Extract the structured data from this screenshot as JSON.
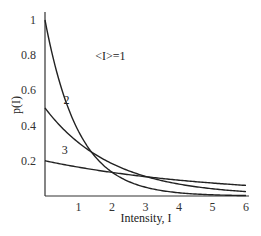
{
  "chart_data": {
    "type": "line",
    "title": "",
    "xlabel": "Intensity, I",
    "ylabel": "p(I)",
    "xlim": [
      0,
      6
    ],
    "ylim": [
      0,
      1
    ],
    "grid": false,
    "legend": "inline curve labels",
    "x_ticks": [
      "1",
      "2",
      "3",
      "4",
      "5",
      "6"
    ],
    "y_ticks": [
      "0.2",
      "0.4",
      "0.6",
      "0.8",
      "1"
    ],
    "function": "p(I) = (1/<I>) exp(-I/<I>)",
    "series": [
      {
        "name": "<I>=1",
        "label": "<I>=1",
        "mean": 1,
        "x": [
          0,
          0.5,
          1,
          1.5,
          2,
          3,
          4,
          5,
          6
        ],
        "values": [
          1.0,
          0.607,
          0.368,
          0.223,
          0.135,
          0.05,
          0.018,
          0.007,
          0.002
        ]
      },
      {
        "name": "2",
        "label": "2",
        "mean": 2,
        "x": [
          0,
          0.5,
          1,
          1.5,
          2,
          3,
          4,
          5,
          6
        ],
        "values": [
          0.5,
          0.389,
          0.303,
          0.236,
          0.184,
          0.112,
          0.068,
          0.041,
          0.025
        ]
      },
      {
        "name": "3",
        "label": "3",
        "mean": 5,
        "x": [
          0,
          0.5,
          1,
          1.5,
          2,
          3,
          4,
          5,
          6
        ],
        "values": [
          0.2,
          0.181,
          0.164,
          0.148,
          0.134,
          0.11,
          0.09,
          0.074,
          0.06
        ]
      }
    ],
    "annotations": [
      {
        "text": "<I>=1",
        "x": 1.5,
        "y": 0.77
      },
      {
        "text": "2",
        "x": 0.55,
        "y": 0.52
      },
      {
        "text": "3",
        "x": 0.5,
        "y": 0.24
      }
    ]
  }
}
